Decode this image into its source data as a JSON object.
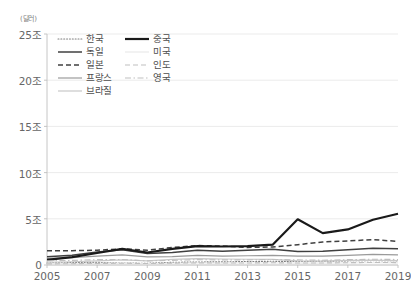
{
  "unit_label": "(달러)",
  "legend": {
    "columns": [
      [
        {
          "label": "한국",
          "style": "dotted",
          "color": "#7f7f7f",
          "width": 1.1
        },
        {
          "label": "독일",
          "style": "solid",
          "color": "#404040",
          "width": 1.5
        },
        {
          "label": "일본",
          "style": "dashed",
          "color": "#404040",
          "width": 1.5
        },
        {
          "label": "프랑스",
          "style": "solid",
          "color": "#9a9a9a",
          "width": 1.2
        },
        {
          "label": "브라질",
          "style": "solid",
          "color": "#c8c8c8",
          "width": 1.2
        }
      ],
      [
        {
          "label": "중국",
          "style": "solid",
          "color": "#1a1a1a",
          "width": 2.2
        },
        {
          "label": "미국",
          "style": "solid",
          "color": "#e8e8e8",
          "width": 1.1
        },
        {
          "label": "인도",
          "style": "dashed",
          "color": "#bfbfbf",
          "width": 1.1
        },
        {
          "label": "영국",
          "style": "dashdot",
          "color": "#bfbfbf",
          "width": 1.1
        }
      ]
    ]
  },
  "chart_data": {
    "type": "line",
    "title": "",
    "xlabel": "",
    "ylabel": "(달러)",
    "grid": "horizontal",
    "legend_position": "top-left-inside",
    "x": [
      2005,
      2006,
      2007,
      2008,
      2009,
      2010,
      2011,
      2012,
      2013,
      2014,
      2015,
      2016,
      2017,
      2018,
      2019
    ],
    "xtick_labels": [
      "2005",
      "2007",
      "2009",
      "2011",
      "2013",
      "2015",
      "2017",
      "2019"
    ],
    "xtick_values": [
      2005,
      2007,
      2009,
      2011,
      2013,
      2015,
      2017,
      2019
    ],
    "xlim": [
      2005,
      2019
    ],
    "ytick_labels": [
      "0",
      "5조",
      "10조",
      "15조",
      "20조",
      "25조"
    ],
    "ytick_values": [
      0,
      5,
      10,
      15,
      20,
      25
    ],
    "ylim": [
      0,
      25
    ],
    "series": [
      {
        "name": "한국",
        "style": "dotted",
        "color": "#7f7f7f",
        "width": 1.1,
        "values": [
          0.22,
          0.26,
          0.29,
          0.21,
          0.19,
          0.29,
          0.33,
          0.34,
          0.38,
          0.4,
          0.38,
          0.4,
          0.45,
          0.48,
          0.45
        ]
      },
      {
        "name": "독일",
        "style": "solid",
        "color": "#404040",
        "width": 1.5,
        "values": [
          0.9,
          1.05,
          1.4,
          1.65,
          1.25,
          1.35,
          1.6,
          1.5,
          1.6,
          1.7,
          1.45,
          1.5,
          1.65,
          1.8,
          1.75
        ]
      },
      {
        "name": "일본",
        "style": "dashed",
        "color": "#404040",
        "width": 1.5,
        "values": [
          1.55,
          1.55,
          1.6,
          1.75,
          1.6,
          1.9,
          2.1,
          2.05,
          1.9,
          1.95,
          2.2,
          2.5,
          2.6,
          2.75,
          2.55
        ]
      },
      {
        "name": "프랑스",
        "style": "solid",
        "color": "#9a9a9a",
        "width": 1.2,
        "values": [
          0.72,
          0.8,
          0.95,
          1.1,
          0.88,
          0.9,
          1.05,
          0.95,
          1.0,
          1.05,
          0.95,
          0.95,
          1.05,
          1.15,
          1.1
        ]
      },
      {
        "name": "브라질",
        "style": "solid",
        "color": "#c8c8c8",
        "width": 1.2,
        "values": [
          0.3,
          0.35,
          0.45,
          0.55,
          0.45,
          0.6,
          0.7,
          0.65,
          0.62,
          0.6,
          0.45,
          0.42,
          0.5,
          0.52,
          0.48
        ]
      },
      {
        "name": "중국",
        "style": "solid",
        "color": "#1a1a1a",
        "width": 2.2,
        "values": [
          0.55,
          0.85,
          1.3,
          1.75,
          1.35,
          1.75,
          2.05,
          2.0,
          2.05,
          2.2,
          4.95,
          3.45,
          3.85,
          4.9,
          5.55
        ]
      },
      {
        "name": "미국",
        "style": "solid",
        "color": "#e8e8e8",
        "width": 1.1,
        "values": [
          0.15,
          0.16,
          0.18,
          0.2,
          0.16,
          0.19,
          0.21,
          0.2,
          0.21,
          0.22,
          0.2,
          0.2,
          0.22,
          0.24,
          0.23
        ]
      },
      {
        "name": "인도",
        "style": "dashed",
        "color": "#bfbfbf",
        "width": 1.1,
        "values": [
          0.12,
          0.14,
          0.17,
          0.19,
          0.16,
          0.2,
          0.23,
          0.22,
          0.22,
          0.24,
          0.22,
          0.22,
          0.25,
          0.27,
          0.26
        ]
      },
      {
        "name": "영국",
        "style": "dashdot",
        "color": "#bfbfbf",
        "width": 1.1,
        "values": [
          0.45,
          0.5,
          0.58,
          0.6,
          0.45,
          0.5,
          0.58,
          0.55,
          0.56,
          0.6,
          0.55,
          0.52,
          0.58,
          0.62,
          0.6
        ]
      }
    ]
  }
}
